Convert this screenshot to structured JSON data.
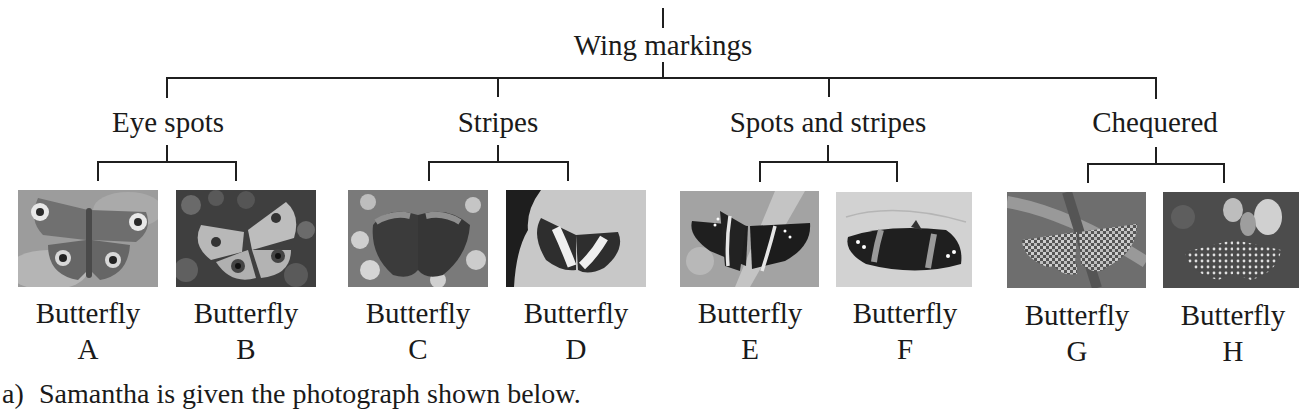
{
  "diagram": {
    "type": "classification-key",
    "root": {
      "label": "Wing markings"
    },
    "categories": [
      {
        "label": "Eye spots",
        "members": [
          "A",
          "B"
        ]
      },
      {
        "label": "Stripes",
        "members": [
          "C",
          "D"
        ]
      },
      {
        "label": "Spots and stripes",
        "members": [
          "E",
          "F"
        ]
      },
      {
        "label": "Chequered",
        "members": [
          "G",
          "H"
        ]
      }
    ],
    "butterflies": [
      {
        "word": "Butterfly",
        "letter": "A",
        "marking": "eye-spots",
        "photo_alt": "butterfly-photo-a"
      },
      {
        "word": "Butterfly",
        "letter": "B",
        "marking": "eye-spots",
        "photo_alt": "butterfly-photo-b"
      },
      {
        "word": "Butterfly",
        "letter": "C",
        "marking": "stripes",
        "photo_alt": "butterfly-photo-c"
      },
      {
        "word": "Butterfly",
        "letter": "D",
        "marking": "stripes",
        "photo_alt": "butterfly-photo-d"
      },
      {
        "word": "Butterfly",
        "letter": "E",
        "marking": "spots-and-stripes",
        "photo_alt": "butterfly-photo-e"
      },
      {
        "word": "Butterfly",
        "letter": "F",
        "marking": "spots-and-stripes",
        "photo_alt": "butterfly-photo-f"
      },
      {
        "word": "Butterfly",
        "letter": "G",
        "marking": "chequered",
        "photo_alt": "butterfly-photo-g"
      },
      {
        "word": "Butterfly",
        "letter": "H",
        "marking": "chequered",
        "photo_alt": "butterfly-photo-h"
      }
    ]
  },
  "question": {
    "number": "a)",
    "text": "Samantha is given the photograph shown below."
  }
}
